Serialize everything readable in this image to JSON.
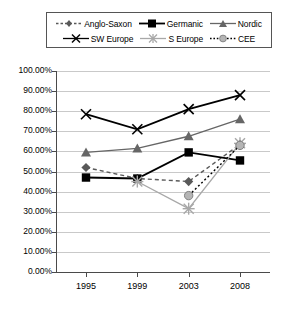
{
  "chart_data": {
    "type": "line",
    "title": "",
    "xlabel": "",
    "ylabel": "",
    "categories": [
      "1995",
      "1999",
      "2003",
      "2008"
    ],
    "ylim": [
      0,
      100
    ],
    "ytick_labels": [
      "100.00%",
      "90.00%",
      "80.00%",
      "70.00%",
      "60.00%",
      "50.00%",
      "40.00%",
      "30.00%",
      "20.00%",
      "10.00%",
      "0.00%"
    ],
    "ytick_values": [
      100,
      90,
      80,
      70,
      60,
      50,
      40,
      30,
      20,
      10,
      0
    ],
    "grid": true,
    "legend_position": "top",
    "series": [
      {
        "name": "Anglo-Saxon",
        "values": [
          52.0,
          46.5,
          45.0,
          63.5
        ],
        "color": "#595959",
        "style": "dashed",
        "marker": "diamond"
      },
      {
        "name": "Germanic",
        "values": [
          47.0,
          46.5,
          59.5,
          55.5
        ],
        "color": "#000000",
        "style": "solid",
        "marker": "square"
      },
      {
        "name": "Nordic",
        "values": [
          59.5,
          61.5,
          67.5,
          76.0
        ],
        "color": "#666666",
        "style": "solid",
        "marker": "triangle"
      },
      {
        "name": "SW Europe",
        "values": [
          78.5,
          71.0,
          81.0,
          88.0
        ],
        "color": "#000000",
        "style": "solid",
        "marker": "cross"
      },
      {
        "name": "S Europe",
        "values": [
          null,
          45.0,
          31.5,
          64.0
        ],
        "color": "#a8a8a8",
        "style": "solid",
        "marker": "star"
      },
      {
        "name": "CEE",
        "values": [
          null,
          null,
          38.0,
          63.0
        ],
        "color": "#000000",
        "style": "dotted",
        "marker": "circle"
      }
    ]
  },
  "legend": {
    "rows": [
      [
        "Anglo-Saxon",
        "Germanic",
        "Nordic"
      ],
      [
        "SW Europe",
        "S Europe",
        "CEE"
      ]
    ]
  }
}
